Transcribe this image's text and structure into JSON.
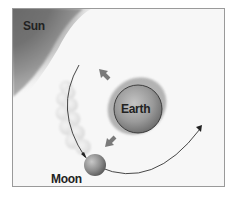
{
  "diagram": {
    "labels": {
      "sun": "Sun",
      "earth": "Earth",
      "moon": "Moon"
    },
    "colors": {
      "background": "#f7f7f7",
      "frame_border": "#9a9a9a",
      "sun_dark": "#6e6e6e",
      "earth_fill": "#9e9e9e",
      "tidal_bulge": "#a8a8a8",
      "moon_fill": "#8a8a8a",
      "trail": "#e2e2e2",
      "orbit_line": "#333333",
      "arrow": "#7a7a7a"
    },
    "elements": [
      "sun",
      "earth",
      "tidal-bulge",
      "moon",
      "moon-trail",
      "orbit-arc",
      "bulge-arrows"
    ]
  }
}
